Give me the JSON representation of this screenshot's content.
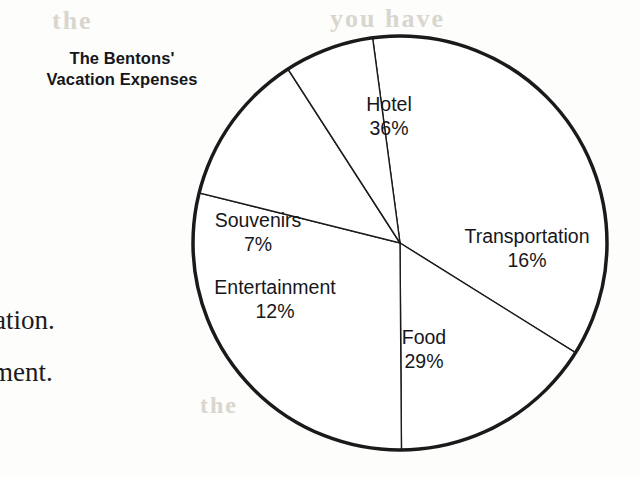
{
  "page": {
    "background_color": "#fdfdfb",
    "ink_color": "#15161a"
  },
  "chart_title": {
    "line1": "The Bentons'",
    "line2": "Vacation Expenses"
  },
  "body_text_fragments": [
    {
      "text": "ation."
    },
    {
      "text": "ment."
    }
  ],
  "ghost_text": [
    {
      "text": "the"
    },
    {
      "text": "you have"
    },
    {
      "text": "c"
    },
    {
      "text": "b"
    },
    {
      "text": "the"
    }
  ],
  "chart_data": {
    "type": "pie",
    "title": "The Bentons' Vacation Expenses",
    "units": "percent",
    "total": 100,
    "legend": "none",
    "labels_inside_slices": true,
    "categories": [
      "Hotel",
      "Transportation",
      "Food",
      "Entertainment",
      "Souvenirs"
    ],
    "values": [
      36,
      16,
      29,
      12,
      7
    ],
    "slices": [
      {
        "name": "Hotel",
        "label": "Hotel",
        "percent": 36,
        "percent_text": "36%",
        "start_angle_deg": 328,
        "end_angle_deg": 457.6,
        "fill": "#ffffff",
        "stroke": "#1a1a1a",
        "label_x": 389,
        "label_y": 117
      },
      {
        "name": "Transportation",
        "label": "Transportation",
        "percent": 16,
        "percent_text": "16%",
        "start_angle_deg": 270.4,
        "end_angle_deg": 328,
        "fill": "#ffffff",
        "stroke": "#1a1a1a",
        "label_x": 527,
        "label_y": 249
      },
      {
        "name": "Food",
        "label": "Food",
        "percent": 29,
        "percent_text": "29%",
        "start_angle_deg": 166,
        "end_angle_deg": 270.4,
        "fill": "#ffffff",
        "stroke": "#1a1a1a",
        "label_x": 424,
        "label_y": 350
      },
      {
        "name": "Entertainment",
        "label": "Entertainment",
        "percent": 12,
        "percent_text": "12%",
        "start_angle_deg": 122.8,
        "end_angle_deg": 166,
        "fill": "#ffffff",
        "stroke": "#1a1a1a",
        "label_x": 275,
        "label_y": 300
      },
      {
        "name": "Souvenirs",
        "label": "Souvenirs",
        "percent": 7,
        "percent_text": "7%",
        "start_angle_deg": 97.6,
        "end_angle_deg": 122.8,
        "fill": "#ffffff",
        "stroke": "#1a1a1a",
        "label_x": 258,
        "label_y": 233
      }
    ],
    "geometry": {
      "center_x": 400,
      "center_y": 243,
      "radius": 207,
      "outline_width": 3.5,
      "divider_width": 1.4
    }
  }
}
